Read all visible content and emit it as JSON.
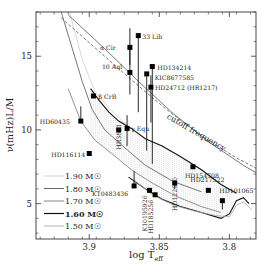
{
  "chart_data": {
    "type": "scatter",
    "title": "",
    "xlabel": "log T_eff",
    "ylabel": "ν(mHz)L/M",
    "xlim": [
      3.938,
      3.781
    ],
    "ylim": [
      2.6,
      18.0
    ],
    "x_reversed": true,
    "grid": false,
    "x_ticks": [
      3.9,
      3.85,
      3.8
    ],
    "x_tick_labels": [
      "3.9",
      "3.85",
      "3.8"
    ],
    "y_ticks": [
      5,
      10,
      15
    ],
    "y_tick_labels": [
      "5",
      "10",
      "15"
    ],
    "points": [
      {
        "name": "33 Lib",
        "x": 3.865,
        "y": 16.4,
        "err_low": 5.2,
        "err_high": 0.0,
        "label_dx": 4,
        "label_dy": 3
      },
      {
        "name": "α Cir",
        "x": 3.871,
        "y": 15.6,
        "err_low": 1.2,
        "err_high": 1.3,
        "label_dx": -30,
        "label_dy": 3
      },
      {
        "name": "HD134214",
        "x": 3.855,
        "y": 14.3,
        "err_low": 6.6,
        "err_high": 0.0,
        "label_dx": 5,
        "label_dy": 3
      },
      {
        "name": "KIC8677585",
        "x": 3.859,
        "y": 13.8,
        "err_low": 5.2,
        "err_high": 0.0,
        "label_dx": 8,
        "label_dy": 6
      },
      {
        "name": "10 Aql",
        "x": 3.871,
        "y": 13.9,
        "err_low": 1.5,
        "err_high": 1.7,
        "label_dx": -28,
        "label_dy": -3
      },
      {
        "name": "HD24712 (HR1217)",
        "x": 3.856,
        "y": 12.9,
        "err_low": 2.4,
        "err_high": 0.8,
        "label_dx": 4,
        "label_dy": 3
      },
      {
        "name": "β CrB",
        "x": 3.897,
        "y": 12.3,
        "err_low": 0.0,
        "err_high": 0.0,
        "label_dx": 5,
        "label_dy": 3
      },
      {
        "name": "HD60435",
        "x": 3.906,
        "y": 10.6,
        "err_low": 0.0,
        "err_high": 1.0,
        "label_dx": -41,
        "label_dy": 3
      },
      {
        "name": "HR3831",
        "x": 3.879,
        "y": 10.0,
        "err_low": 0.0,
        "err_high": 0.0,
        "label_dx": 2,
        "label_dy": -6,
        "rotated": true
      },
      {
        "name": "γ Equ",
        "x": 3.873,
        "y": 10.1,
        "err_low": 1.2,
        "err_high": 0.9,
        "label_dx": 4,
        "label_dy": 3
      },
      {
        "name": "HD116114",
        "x": 3.9,
        "y": 8.4,
        "err_low": 0.0,
        "err_high": 0.0,
        "label_dx": -38,
        "label_dy": 3
      },
      {
        "name": "HD154708",
        "x": 3.826,
        "y": 7.5,
        "err_low": 0.0,
        "err_high": 0.0,
        "label_dx": -8,
        "label_dy": 11
      },
      {
        "name": "HD122970",
        "x": 3.839,
        "y": 6.4,
        "err_low": 0.4,
        "err_high": 0.0,
        "label_dx": 2,
        "label_dy": -6,
        "rotated": true
      },
      {
        "name": "HD217522",
        "x": 3.815,
        "y": 5.9,
        "err_low": 0.0,
        "err_high": 0.0,
        "label_dx": -18,
        "label_dy": -8
      },
      {
        "name": "HD101065",
        "x": 3.805,
        "y": 5.2,
        "err_low": 0.6,
        "err_high": 0.0,
        "label_dx": -3,
        "label_dy": -8
      },
      {
        "name": "K10483436",
        "x": 3.868,
        "y": 6.2,
        "err_low": 0.0,
        "err_high": 1.0,
        "label_dx": -42,
        "label_dy": 10
      },
      {
        "name": "K10195926",
        "x": 3.857,
        "y": 5.9,
        "err_low": 0.0,
        "err_high": 0.0,
        "label_dx": -2,
        "label_dy": 5,
        "rotated": true
      },
      {
        "name": "HD185256",
        "x": 3.853,
        "y": 5.6,
        "err_low": 0.0,
        "err_high": 0.0,
        "label_dx": -2,
        "label_dy": 5,
        "rotated": true
      }
    ],
    "annotations": [
      {
        "text": "cutoff frequency",
        "x": 3.845,
        "y": 10.8,
        "rotation": 30
      }
    ],
    "cutoff_curves": {
      "dashed": [
        [
          3.92,
          17.6
        ],
        [
          3.895,
          15.5
        ],
        [
          3.87,
          13.4
        ],
        [
          3.845,
          11.4
        ],
        [
          3.82,
          9.6
        ],
        [
          3.795,
          8.1
        ],
        [
          3.781,
          7.4
        ]
      ],
      "solid": [
        [
          3.915,
          17.8
        ],
        [
          3.89,
          15.6
        ],
        [
          3.865,
          13.3
        ],
        [
          3.84,
          11.1
        ],
        [
          3.815,
          9.2
        ],
        [
          3.79,
          7.6
        ],
        [
          3.781,
          7.1
        ]
      ]
    },
    "legend": {
      "position": "lower-left",
      "entries": [
        {
          "label": "1.90 M☉",
          "color": "#cfcfcf"
        },
        {
          "label": "1.80 M☉",
          "color": "#555555"
        },
        {
          "label": "1.70 M☉",
          "color": "#777777"
        },
        {
          "label": "1.60 M☉",
          "color": "#111111"
        },
        {
          "label": "1.50 M☉",
          "color": "#aaaaaa"
        }
      ]
    },
    "tracks": [
      {
        "mass": "1.90",
        "color": "#cfcfcf",
        "points": [
          [
            3.914,
            18.0
          ],
          [
            3.905,
            14.8
          ],
          [
            3.896,
            12.6
          ],
          [
            3.885,
            11.4
          ],
          [
            3.872,
            10.2
          ]
        ]
      },
      {
        "mass": "1.80",
        "color": "#555555",
        "points": [
          [
            3.92,
            18.0
          ],
          [
            3.912,
            15.5
          ],
          [
            3.905,
            13.3
          ],
          [
            3.898,
            11.4
          ],
          [
            3.889,
            10.0
          ],
          [
            3.876,
            8.9
          ],
          [
            3.86,
            7.6
          ],
          [
            3.84,
            6.5
          ],
          [
            3.82,
            5.8
          ]
        ]
      },
      {
        "mass": "1.70",
        "color": "#777777",
        "points": [
          [
            3.915,
            12.8
          ],
          [
            3.906,
            10.6
          ],
          [
            3.896,
            9.3
          ],
          [
            3.884,
            8.4
          ],
          [
            3.87,
            7.3
          ],
          [
            3.855,
            6.4
          ],
          [
            3.838,
            5.5
          ],
          [
            3.82,
            4.8
          ],
          [
            3.806,
            4.4
          ]
        ]
      },
      {
        "mass": "1.60",
        "color": "#111111",
        "points": [
          [
            3.899,
            12.8
          ],
          [
            3.893,
            12.0
          ],
          [
            3.886,
            11.2
          ],
          [
            3.879,
            10.6
          ],
          [
            3.87,
            10.1
          ],
          [
            3.86,
            9.4
          ],
          [
            3.848,
            8.9
          ],
          [
            3.835,
            8.2
          ],
          [
            3.82,
            7.3
          ],
          [
            3.806,
            6.3
          ],
          [
            3.795,
            5.7
          ]
        ]
      },
      {
        "mass": "1.60b",
        "color": "#111111",
        "points": [
          [
            3.872,
            6.8
          ],
          [
            3.86,
            6.0
          ],
          [
            3.848,
            5.3
          ],
          [
            3.835,
            4.8
          ],
          [
            3.82,
            4.4
          ],
          [
            3.806,
            4.0
          ],
          [
            3.8,
            4.3
          ],
          [
            3.795,
            5.2
          ],
          [
            3.79,
            5.4
          ],
          [
            3.786,
            5.0
          ]
        ]
      },
      {
        "mass": "1.50",
        "color": "#aaaaaa",
        "points": [
          [
            3.868,
            6.6
          ],
          [
            3.855,
            5.6
          ],
          [
            3.84,
            4.9
          ],
          [
            3.825,
            4.5
          ],
          [
            3.81,
            4.2
          ],
          [
            3.8,
            4.1
          ],
          [
            3.795,
            4.9
          ],
          [
            3.79,
            5.1
          ],
          [
            3.784,
            4.6
          ]
        ]
      }
    ],
    "instability_strip_hatch": {
      "x_from": 3.905,
      "x_to": 3.797,
      "y_top_track": "1.60",
      "y_bottom_track": "1.60b"
    }
  }
}
